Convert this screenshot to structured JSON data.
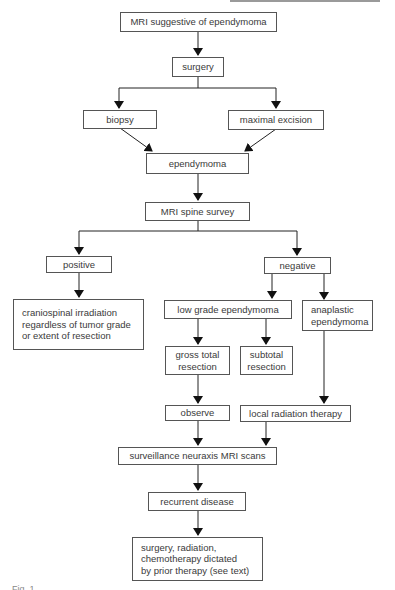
{
  "diagram": {
    "nodes": {
      "mri": "MRI suggestive of ependymoma",
      "surgery": "surgery",
      "biopsy": "biopsy",
      "maximal_excision": "maximal excision",
      "ependymoma": "ependymoma",
      "mri_spine": "MRI spine survey",
      "positive": "positive",
      "negative": "negative",
      "craniospinal": "craniospinal irradiation\nregardless of tumor grade\nor extent of resection",
      "low_grade": "low grade ependymoma",
      "anaplastic": "anaplastic\nependymoma",
      "gross_total": "gross total\nresection",
      "subtotal": "subtotal\nresection",
      "observe": "observe",
      "local_radiation": "local radiation therapy",
      "surveillance": "surveillance neuraxis MRI scans",
      "recurrent": "recurrent disease",
      "final": "surgery, radiation,\nchemotherapy dictated\nby prior therapy (see text)"
    },
    "edges": [
      [
        "mri",
        "surgery"
      ],
      [
        "surgery",
        "biopsy"
      ],
      [
        "surgery",
        "maximal_excision"
      ],
      [
        "biopsy",
        "ependymoma"
      ],
      [
        "maximal_excision",
        "ependymoma"
      ],
      [
        "ependymoma",
        "mri_spine"
      ],
      [
        "mri_spine",
        "positive"
      ],
      [
        "mri_spine",
        "negative"
      ],
      [
        "positive",
        "craniospinal"
      ],
      [
        "negative",
        "low_grade"
      ],
      [
        "negative",
        "anaplastic"
      ],
      [
        "low_grade",
        "gross_total"
      ],
      [
        "low_grade",
        "subtotal"
      ],
      [
        "gross_total",
        "observe"
      ],
      [
        "subtotal",
        "local_radiation"
      ],
      [
        "anaplastic",
        "local_radiation"
      ],
      [
        "observe",
        "surveillance"
      ],
      [
        "local_radiation",
        "surveillance"
      ],
      [
        "surveillance",
        "recurrent"
      ],
      [
        "recurrent",
        "final"
      ]
    ],
    "caption": "Fig. 1"
  }
}
